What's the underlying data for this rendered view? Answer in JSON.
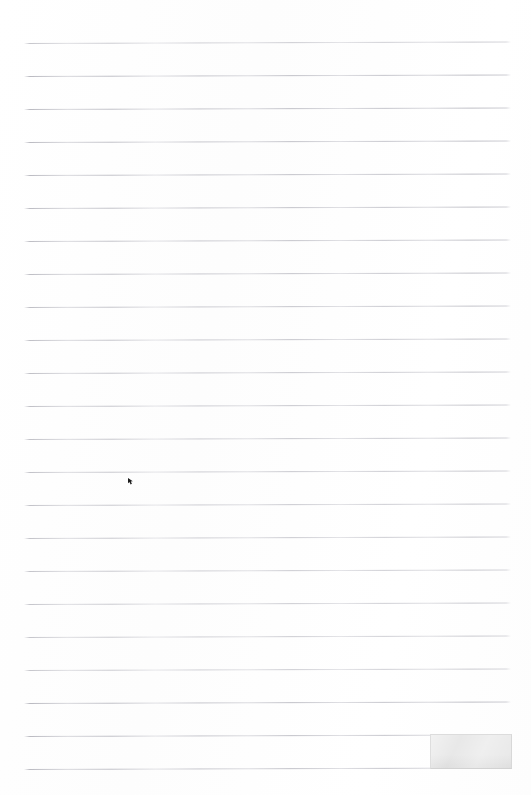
{
  "document": {
    "kind": "scanned-lined-paper",
    "page_width": 531,
    "page_height": 795,
    "background_color": "#fefefe",
    "has_text": false,
    "written_content": "",
    "notes_text": ""
  },
  "ruling": {
    "line_count": 23,
    "first_line_y": 41,
    "line_spacing": 33,
    "line_left_x": 24,
    "line_right_x": 511,
    "line_thickness": 1,
    "line_color": "#c9c9ce",
    "line_tilt_px": 1.5,
    "lines_y": [
      41,
      74,
      107,
      140,
      173,
      206,
      239,
      272,
      305,
      338,
      371,
      404,
      437,
      470,
      503,
      536,
      569,
      602,
      635,
      668,
      701,
      734,
      767
    ]
  },
  "marks": {
    "gray_patch": {
      "label": "gray-patch",
      "x": 430,
      "y": 734,
      "width": 82,
      "height": 35,
      "color": "#e8e8e8"
    },
    "ink_mark": {
      "label": "ink-mark",
      "x": 128,
      "y": 478,
      "width": 6,
      "height": 7,
      "color": "#1c1c1c"
    }
  }
}
